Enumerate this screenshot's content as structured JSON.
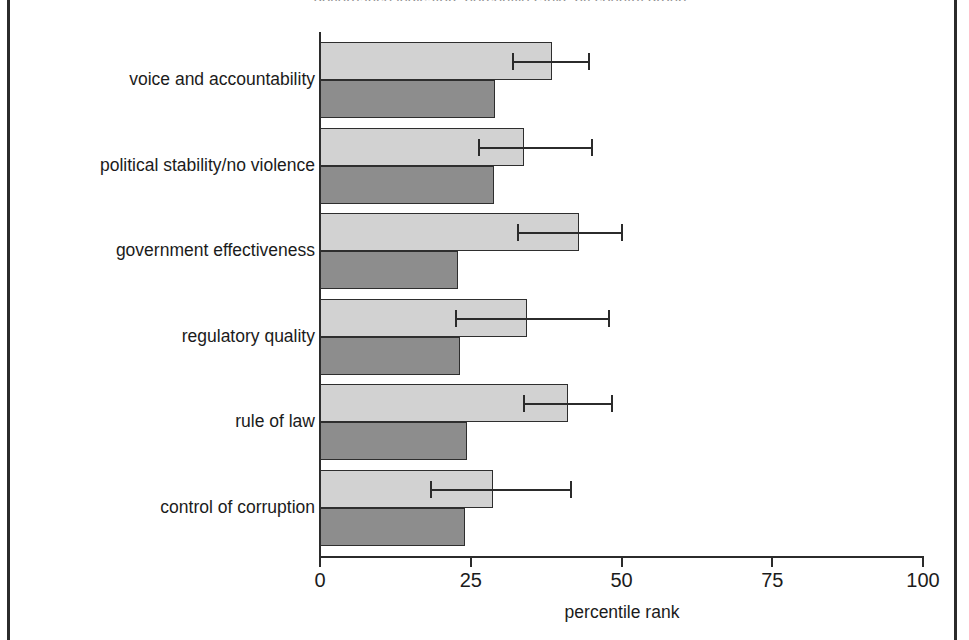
{
  "figure": {
    "title": "governance indicators percentile ranks by country group",
    "border_color": "#2b2b2b",
    "background": "#ffffff"
  },
  "chart_data": {
    "type": "bar",
    "orientation": "horizontal",
    "title": "governance indicators percentile ranks by country group",
    "xlabel": "percentile rank",
    "ylabel": "",
    "xlim": [
      0,
      100
    ],
    "xticks": [
      "0",
      "25",
      "50",
      "75",
      "100"
    ],
    "xtick_values": [
      0,
      25,
      50,
      75,
      100
    ],
    "grid": false,
    "legend": "none",
    "categories": [
      "voice and accountability",
      "political stability/no violence",
      "government effectiveness",
      "regulatory quality",
      "rule of law",
      "control of corruption"
    ],
    "series": [
      {
        "name": "light",
        "color": "#d2d2d2",
        "values": [
          38.5,
          33.8,
          42.9,
          34.3,
          41.1,
          28.7
        ],
        "error_low": [
          31.8,
          26.2,
          32.7,
          22.4,
          33.7,
          18.2
        ],
        "error_high": [
          44.8,
          45.3,
          50.2,
          48.1,
          48.6,
          41.8
        ]
      },
      {
        "name": "dark",
        "color": "#8d8d8d",
        "values": [
          29.0,
          28.9,
          22.9,
          23.2,
          24.4,
          24.0
        ]
      }
    ]
  }
}
